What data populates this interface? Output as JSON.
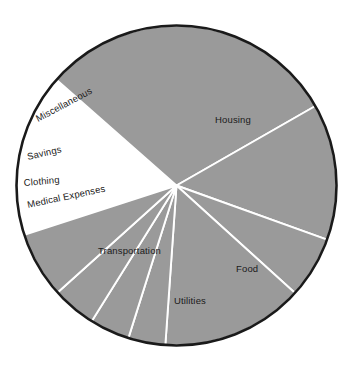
{
  "figure": {
    "background_color": "#ffffff",
    "slice_fill_color": "#9a9a9a",
    "slice_edge_color": "#ffffff",
    "outline_color": "#1a1a1a",
    "label_color": "#1a1a1a"
  },
  "chart_data": {
    "type": "pie",
    "title": "",
    "subtitle": "",
    "xlabel": "",
    "ylabel": "",
    "legend_position": "none",
    "grid": false,
    "labels_placement": "inside-slice",
    "start_angle_deg": 138.6,
    "direction": "clockwise",
    "categories": [
      "Housing",
      "Food",
      "Utilities",
      "Transportation",
      "Medical Expenses",
      "Clothing",
      "Savings",
      "Miscellaneous"
    ],
    "values": [
      30.2,
      17.0,
      9.0,
      18.1,
      5.0,
      5.3,
      6.0,
      9.4
    ],
    "slices": [
      {
        "label": "Housing",
        "value": 30.2,
        "start_angle_deg": 138.6,
        "end_angle_deg": 29.8,
        "sweep_deg": 108.8,
        "label_x": 215,
        "label_y": 123,
        "label_rotation_deg": 0
      },
      {
        "label": "Food",
        "value": 17.0,
        "start_angle_deg": 29.8,
        "end_angle_deg": -19.8,
        "sweep_deg": 49.6,
        "label_x": 236,
        "label_y": 272,
        "label_rotation_deg": 0
      },
      {
        "label": "Utilities",
        "value": 9.0,
        "start_angle_deg": -19.8,
        "end_angle_deg": -42.2,
        "sweep_deg": 22.4,
        "label_x": 174,
        "label_y": 304,
        "label_rotation_deg": 0
      },
      {
        "label": "Transportation",
        "value": 18.1,
        "start_angle_deg": -42.2,
        "end_angle_deg": -94.0,
        "sweep_deg": 51.8,
        "label_x": 98,
        "label_y": 254,
        "label_rotation_deg": 0
      },
      {
        "label": "Medical Expenses",
        "value": 5.0,
        "start_angle_deg": -94.0,
        "end_angle_deg": -107.5,
        "sweep_deg": 13.5,
        "label_x": 28,
        "label_y": 208,
        "label_rotation_deg": -12
      },
      {
        "label": "Clothing",
        "value": 5.3,
        "start_angle_deg": -107.5,
        "end_angle_deg": -122.0,
        "sweep_deg": 14.5,
        "label_x": 24,
        "label_y": 186,
        "label_rotation_deg": -5
      },
      {
        "label": "Savings",
        "value": 6.0,
        "start_angle_deg": -122.0,
        "end_angle_deg": -138.0,
        "sweep_deg": 16.0,
        "label_x": 28,
        "label_y": 160,
        "label_rotation_deg": -13
      },
      {
        "label": "Miscellaneous",
        "value": 9.4,
        "start_angle_deg": -138.0,
        "end_angle_deg": -162.0,
        "sweep_deg": 24.0,
        "label_x": 38,
        "label_y": 122,
        "label_rotation_deg": -28
      }
    ],
    "geometry": {
      "center_x": 176.5,
      "center_y": 185.5,
      "radius": 160
    }
  }
}
